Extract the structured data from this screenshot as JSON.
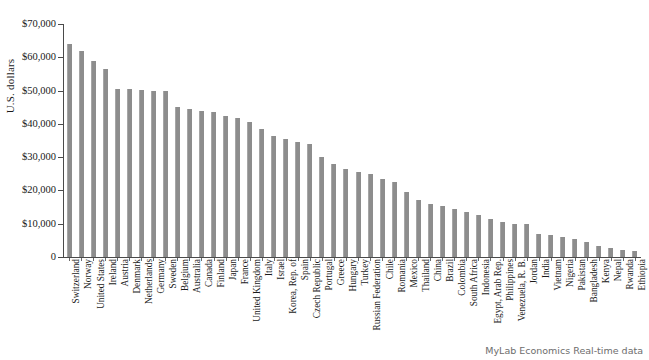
{
  "chart_data": {
    "type": "bar",
    "title": "",
    "xlabel": "",
    "ylabel": "U.S. dollars",
    "ylim": [
      0,
      70000
    ],
    "ytick_values": [
      0,
      10000,
      20000,
      30000,
      40000,
      50000,
      60000,
      70000
    ],
    "ytick_labels": [
      "0",
      "$10,000",
      "$20,000",
      "$30,000",
      "$40,000",
      "$50,000",
      "$60,000",
      "$70,000"
    ],
    "grid": false,
    "legend": false,
    "bar_color": "#8d8d8d",
    "categories": [
      "Switzerland",
      "Norway",
      "United States",
      "Ireland",
      "Austria",
      "Denmark",
      "Netherlands",
      "Germany",
      "Sweden",
      "Belgium",
      "Australia",
      "Canada",
      "Finland",
      "Japan",
      "France",
      "United Kingdom",
      "Italy",
      "Israel",
      "Korea, Rep. of",
      "Spain",
      "Czech Republic",
      "Portugal",
      "Greece",
      "Hungary",
      "Turkey",
      "Russian Federation",
      "Chile",
      "Romania",
      "Mexico",
      "Thailand",
      "China",
      "Brazil",
      "Colombia",
      "South Africa",
      "Indonesia",
      "Egypt, Arab Rep.",
      "Philippines",
      "Venezuela, R. B.",
      "Jordan",
      "India",
      "Vietnam",
      "Nigeria",
      "Pakistan",
      "Bangladesh",
      "Kenya",
      "Nepal",
      "Rwanda",
      "Ethiopia"
    ],
    "values": [
      64000,
      62000,
      59000,
      56500,
      50500,
      50500,
      50200,
      50000,
      49800,
      45000,
      44500,
      44000,
      43500,
      42500,
      41800,
      40500,
      38500,
      36500,
      35500,
      34500,
      34000,
      30000,
      28000,
      26500,
      25500,
      24800,
      23500,
      22500,
      19500,
      17000,
      16000,
      15200,
      14500,
      13500,
      12500,
      11500,
      10500,
      10000,
      9800,
      7000,
      6500,
      6000,
      5500,
      4500,
      3200,
      2600,
      2100,
      1800
    ]
  },
  "footer": {
    "note": "MyLab Economics Real-time data"
  }
}
